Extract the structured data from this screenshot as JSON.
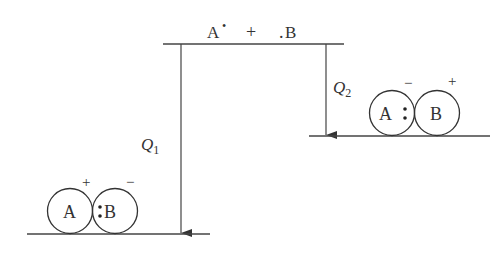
{
  "diagram": {
    "type": "energy-level-diagram",
    "reactants_label": {
      "a": "A",
      "a_dot": "•",
      "plus": "+",
      "b_dot": ".",
      "b": "B"
    },
    "arrows": [
      {
        "label": "Q",
        "subscript": "1",
        "from": "A• + .B",
        "to": "A+ :B−"
      },
      {
        "label": "Q",
        "subscript": "2",
        "from": "A• + .B",
        "to": "A:− B+"
      }
    ],
    "left_product": {
      "atom_a": "A",
      "atom_b": "B",
      "bond_dots": ":",
      "charge_a": "+",
      "charge_b": "−"
    },
    "right_product": {
      "atom_a": "A",
      "atom_b": "B",
      "bond_dots": ":",
      "charge_a": "−",
      "charge_b": "+"
    },
    "colors": {
      "line": "#444444",
      "text": "#333333",
      "background": "#ffffff"
    }
  }
}
